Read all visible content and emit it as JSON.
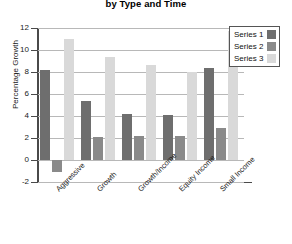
{
  "chart_data": {
    "type": "bar",
    "title": "by Type and Time",
    "xlabel": "",
    "ylabel": "Percentage Growth",
    "ylim": [
      -2,
      12
    ],
    "ytick_step": 2,
    "yticks": [
      12,
      10,
      8,
      6,
      4,
      2,
      0,
      -2
    ],
    "ytick_labels": [
      "12",
      "10",
      "8",
      "6",
      "4",
      "2",
      "0",
      "-2"
    ],
    "grid": true,
    "legend_position": "top-right",
    "categories": [
      "Aggressive",
      "Growth",
      "Growth/Income",
      "Equity Income",
      "Small Income"
    ],
    "series": [
      {
        "name": "Series 1",
        "color": "#6e6e6e",
        "values": [
          8.2,
          5.4,
          4.2,
          4.1,
          8.4
        ]
      },
      {
        "name": "Series 2",
        "color": "#8a8a8a",
        "values": [
          -1.1,
          2.1,
          2.2,
          2.2,
          2.9
        ]
      },
      {
        "name": "Series 3",
        "color": "#d9d9d9",
        "values": [
          11.0,
          9.4,
          8.6,
          8.0,
          11.7
        ]
      }
    ]
  },
  "legend": {
    "items": [
      {
        "label": "Series 1",
        "color": "#6e6e6e"
      },
      {
        "label": "Series 2",
        "color": "#8a8a8a"
      },
      {
        "label": "Series 3",
        "color": "#d9d9d9"
      }
    ]
  },
  "colors": {
    "axis": "#4a4a4a",
    "grid": "#b8b8b8",
    "text": "#1a1a1a",
    "background": "#ffffff"
  }
}
